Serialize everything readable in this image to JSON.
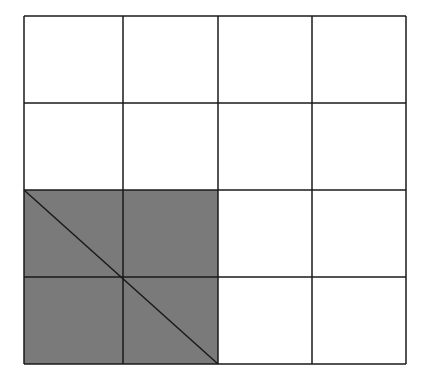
{
  "diagram": {
    "type": "grid",
    "rows": 4,
    "cols": 4,
    "origin": [
      24,
      16
    ],
    "col_edges": [
      24,
      123,
      218,
      312,
      406
    ],
    "row_edges": [
      16,
      103,
      190,
      277,
      364
    ],
    "line_color": "#1a1a1a",
    "line_width": 1.5,
    "background_color": "#ffffff",
    "shaded_region": {
      "col_start": 0,
      "col_end": 2,
      "row_start": 2,
      "row_end": 4,
      "fill_color": "#7a7a7a"
    },
    "diagonal": {
      "from": [
        24,
        190
      ],
      "to": [
        218,
        364
      ],
      "color": "#1a1a1a"
    }
  }
}
